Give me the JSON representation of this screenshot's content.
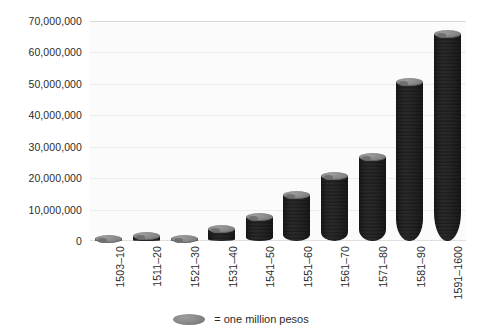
{
  "chart_data": {
    "type": "bar",
    "title": "",
    "subtitle": "",
    "xlabel": "",
    "ylabel": "",
    "grid": true,
    "legend_position": "bottom-center",
    "ylim": [
      0,
      70000000
    ],
    "ytick_values": [
      0,
      10000000,
      20000000,
      30000000,
      40000000,
      50000000,
      60000000,
      70000000
    ],
    "ytick_labels": [
      "0",
      "10,000,000",
      "20,000,000",
      "30,000,000",
      "40,000,000",
      "50,000,000",
      "60,000,000",
      "70,000,000"
    ],
    "categories": [
      "1503–10",
      "1511–20",
      "1521–30",
      "1531–40",
      "1541–50",
      "1551–60",
      "1561–70",
      "1571–80",
      "1581–90",
      "1591–1600"
    ],
    "values": [
      2000000,
      3000000,
      2000000,
      5000000,
      9000000,
      16000000,
      22000000,
      28000000,
      52000000,
      67000000
    ],
    "series": [
      {
        "name": "= one million pesos",
        "values": [
          2000000,
          3000000,
          2000000,
          5000000,
          9000000,
          16000000,
          22000000,
          28000000,
          52000000,
          67000000
        ]
      }
    ],
    "unit_per_coin": 1000000,
    "colors": {
      "bar": "#7f7f7f",
      "bar_highlight": "#9a9a9a",
      "bar_shadow": "#575757",
      "gridline": "#ececec",
      "plot_background": "#fbfbfb",
      "page_background": "#ffffff",
      "text": "#2b2b2b"
    }
  },
  "legend": {
    "coin_icon": "coin-ellipse-icon",
    "label": "= one million pesos"
  }
}
